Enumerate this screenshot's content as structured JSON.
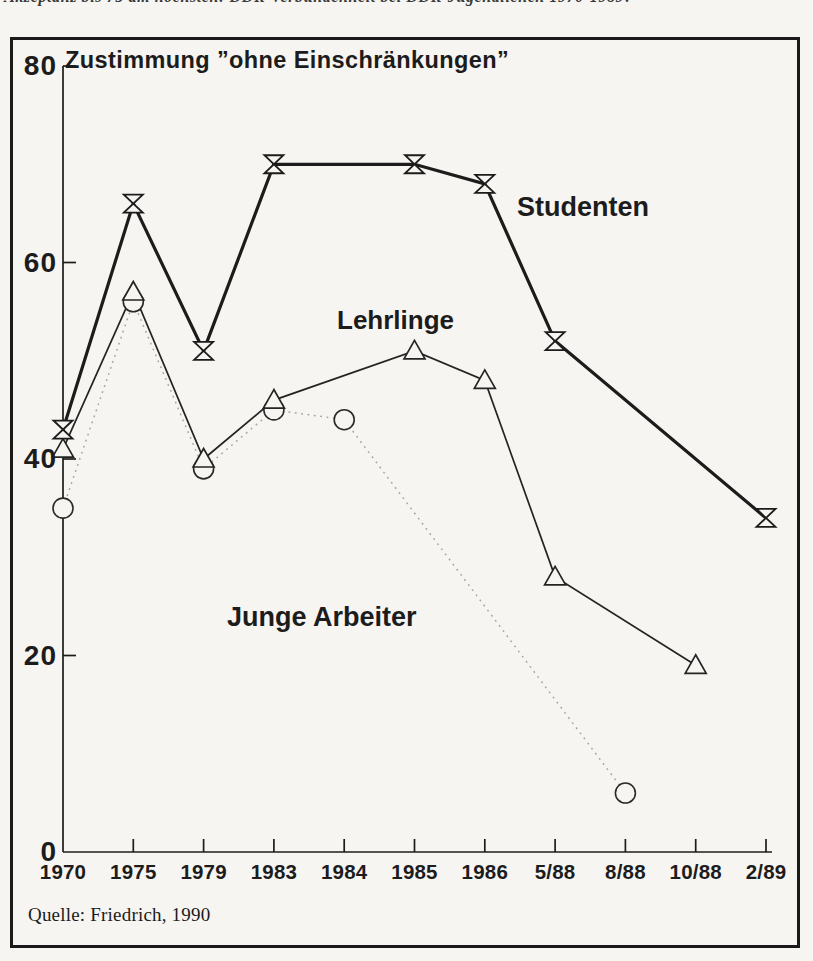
{
  "page": {
    "top_caption_clipped": "Akzeptanz bis 75 am höchsten: DDR-Verbundenheit bei DDR-Jugendlichen 1970-1989?"
  },
  "chart_data": {
    "type": "line",
    "title": "Zustimmung ”ohne Einschränkungen”",
    "source": "Quelle: Friedrich, 1990",
    "xlabel": "",
    "ylabel": "",
    "categories": [
      "1970",
      "1975",
      "1979",
      "1983",
      "1984",
      "1985",
      "1986",
      "5/88",
      "8/88",
      "10/88",
      "2/89"
    ],
    "y_ticks": [
      "0",
      "20",
      "40",
      "60",
      "80"
    ],
    "ylim": [
      0,
      80
    ],
    "grid": false,
    "legend_position": "inline-text-labels",
    "colors": {
      "ink": "#1c1c1c",
      "paper": "#f7f5f1",
      "dotted_line": "#a9a59c"
    },
    "series": [
      {
        "name": "Studenten",
        "marker": "hourglass",
        "line_style": "solid-thick",
        "points": [
          [
            "1970",
            43
          ],
          [
            "1975",
            66
          ],
          [
            "1979",
            51
          ],
          [
            "1983",
            70
          ],
          [
            "1985",
            70
          ],
          [
            "1986",
            68
          ],
          [
            "5/88",
            52
          ],
          [
            "2/89",
            34
          ]
        ]
      },
      {
        "name": "Lehrlinge",
        "marker": "triangle-up",
        "line_style": "solid",
        "points": [
          [
            "1970",
            41
          ],
          [
            "1975",
            57
          ],
          [
            "1979",
            40
          ],
          [
            "1983",
            46
          ],
          [
            "1985",
            51
          ],
          [
            "1986",
            48
          ],
          [
            "5/88",
            28
          ],
          [
            "10/88",
            19
          ]
        ]
      },
      {
        "name": "Junge Arbeiter",
        "marker": "circle",
        "line_style": "dotted",
        "points": [
          [
            "1970",
            35
          ],
          [
            "1975",
            56
          ],
          [
            "1979",
            39
          ],
          [
            "1983",
            45
          ],
          [
            "1984",
            44
          ],
          [
            "8/88",
            6
          ]
        ]
      }
    ]
  }
}
